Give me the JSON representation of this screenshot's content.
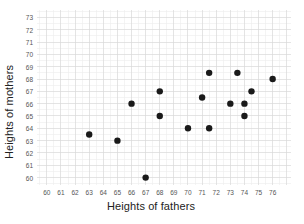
{
  "chart_data": {
    "type": "scatter",
    "title": "",
    "xlabel": "Heights of fathers",
    "ylabel": "Heights of mothers",
    "xlim": [
      59.3,
      77.3
    ],
    "ylim": [
      59.4,
      73.6
    ],
    "xticks": [
      60,
      61,
      62,
      63,
      64,
      65,
      66,
      67,
      68,
      69,
      70,
      71,
      72,
      73,
      74,
      75,
      76
    ],
    "yticks": [
      60,
      61,
      62,
      63,
      64,
      65,
      66,
      67,
      68,
      69,
      70,
      71,
      72,
      73
    ],
    "grid": true,
    "minor_grid": true,
    "minor_step": 0.5,
    "legend": "none",
    "marker": "circle",
    "marker_color": "#1a1a1a",
    "marker_size": 3.2,
    "grid_color": "#d8d8d8",
    "minor_grid_color": "#ececec",
    "points": [
      {
        "x": 63.0,
        "y": 63.5
      },
      {
        "x": 65.0,
        "y": 63.0
      },
      {
        "x": 66.0,
        "y": 66.0
      },
      {
        "x": 67.0,
        "y": 60.0
      },
      {
        "x": 68.0,
        "y": 67.0
      },
      {
        "x": 68.0,
        "y": 65.0
      },
      {
        "x": 70.0,
        "y": 64.0
      },
      {
        "x": 71.0,
        "y": 66.5
      },
      {
        "x": 71.5,
        "y": 68.5
      },
      {
        "x": 71.5,
        "y": 64.0
      },
      {
        "x": 73.0,
        "y": 66.0
      },
      {
        "x": 73.5,
        "y": 68.5
      },
      {
        "x": 74.0,
        "y": 66.0
      },
      {
        "x": 74.0,
        "y": 65.0
      },
      {
        "x": 74.5,
        "y": 67.0
      },
      {
        "x": 76.0,
        "y": 68.0
      }
    ]
  }
}
